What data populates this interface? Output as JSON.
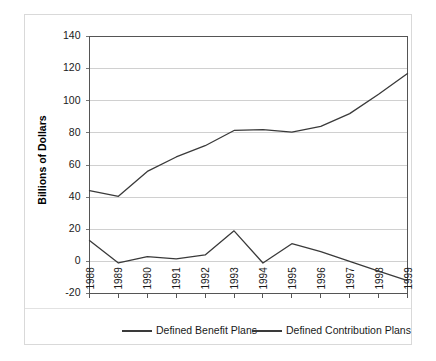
{
  "chart_data": {
    "type": "line",
    "title": "",
    "xlabel": "",
    "ylabel": "Billions of Dollars",
    "x": [
      1988,
      1989,
      1990,
      1991,
      1992,
      1993,
      1994,
      1995,
      1996,
      1997,
      1998,
      1999
    ],
    "categories": [
      "1988",
      "1989",
      "1990",
      "1991",
      "1992",
      "1993",
      "1994",
      "1995",
      "1996",
      "1997",
      "1998",
      "1999"
    ],
    "series": [
      {
        "name": "Defined Benefit Plans",
        "color": "#3a3a3a",
        "values": [
          13,
          -1,
          3,
          1.5,
          4,
          19,
          -1,
          11,
          6,
          0,
          -6,
          -12
        ]
      },
      {
        "name": "Defined Contribution Plans",
        "color": "#3a3a3a",
        "values": [
          44,
          40.5,
          56,
          65,
          72,
          81.5,
          82,
          80.5,
          84,
          92,
          104,
          117
        ]
      }
    ],
    "ylim": [
      -20,
      140
    ],
    "yticks": [
      -20,
      0,
      20,
      40,
      60,
      80,
      100,
      120,
      140
    ],
    "ytick_labels": [
      "-20",
      "0",
      "20",
      "40",
      "60",
      "80",
      "100",
      "120",
      "140"
    ],
    "grid": "horizontal",
    "legend_position": "bottom",
    "xtick_rotation": -90
  },
  "legend": {
    "entries": [
      {
        "label": "Defined Benefit Plans"
      },
      {
        "label": "Defined Contribution Plans"
      }
    ]
  }
}
